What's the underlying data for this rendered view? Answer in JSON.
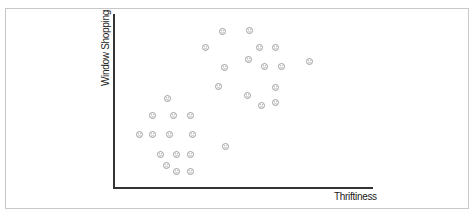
{
  "chart_data": {
    "type": "scatter",
    "title": "",
    "xlabel": "Thriftiness",
    "ylabel": "Window Shopping",
    "xlim": [
      0,
      100
    ],
    "ylim": [
      0,
      100
    ],
    "grid": false,
    "ticks": false,
    "legend": null,
    "marker": "face-icon",
    "marker_color": "#8a8a8a",
    "series": [
      {
        "name": "upper-right cluster",
        "points": [
          {
            "x": 41.7,
            "y": 89.7
          },
          {
            "x": 52.5,
            "y": 90.8
          },
          {
            "x": 35.5,
            "y": 80.5
          },
          {
            "x": 56.0,
            "y": 80.5
          },
          {
            "x": 62.5,
            "y": 80.5
          },
          {
            "x": 52.1,
            "y": 73.6
          },
          {
            "x": 42.5,
            "y": 69.5
          },
          {
            "x": 58.3,
            "y": 70.1
          },
          {
            "x": 64.5,
            "y": 70.1
          },
          {
            "x": 75.3,
            "y": 72.9
          },
          {
            "x": 40.2,
            "y": 58.6
          },
          {
            "x": 62.5,
            "y": 58.0
          },
          {
            "x": 51.7,
            "y": 53.4
          },
          {
            "x": 62.5,
            "y": 49.4
          },
          {
            "x": 57.1,
            "y": 47.7
          }
        ]
      },
      {
        "name": "lower-left cluster",
        "points": [
          {
            "x": 20.5,
            "y": 51.7
          },
          {
            "x": 14.7,
            "y": 41.4
          },
          {
            "x": 22.8,
            "y": 41.4
          },
          {
            "x": 29.7,
            "y": 41.4
          },
          {
            "x": 10.0,
            "y": 30.5
          },
          {
            "x": 14.7,
            "y": 30.5
          },
          {
            "x": 21.6,
            "y": 30.5
          },
          {
            "x": 30.5,
            "y": 30.5
          },
          {
            "x": 17.8,
            "y": 19.0
          },
          {
            "x": 24.3,
            "y": 19.0
          },
          {
            "x": 29.7,
            "y": 19.0
          },
          {
            "x": 42.9,
            "y": 24.1
          },
          {
            "x": 20.1,
            "y": 13.2
          },
          {
            "x": 24.3,
            "y": 9.2
          },
          {
            "x": 29.7,
            "y": 9.2
          }
        ]
      }
    ]
  },
  "axes": {
    "x_label": "Thriftiness",
    "y_label": "Window Shopping"
  }
}
